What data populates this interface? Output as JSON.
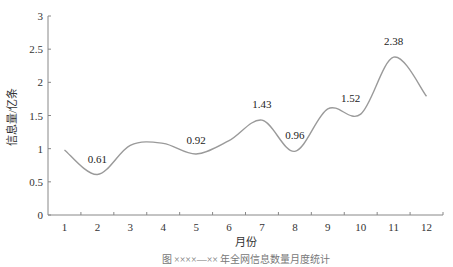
{
  "chart_data": {
    "type": "line",
    "title": "",
    "xlabel": "月份",
    "ylabel": "信息量/亿条",
    "categories": [
      "1",
      "2",
      "3",
      "4",
      "5",
      "6",
      "7",
      "8",
      "9",
      "10",
      "11",
      "12"
    ],
    "x": [
      1,
      2,
      3,
      4,
      5,
      6,
      7,
      8,
      9,
      10,
      11,
      12
    ],
    "values": [
      0.98,
      0.61,
      1.05,
      1.08,
      0.92,
      1.12,
      1.43,
      0.96,
      1.6,
      1.52,
      2.38,
      1.79
    ],
    "data_labels": [
      {
        "x": 2,
        "text": "0.61"
      },
      {
        "x": 5,
        "text": "0.92"
      },
      {
        "x": 7,
        "text": "1.43"
      },
      {
        "x": 8,
        "text": "0.96"
      },
      {
        "x": 10,
        "text": "1.52"
      },
      {
        "x": 11,
        "text": "2.38"
      }
    ],
    "yticks": [
      "0",
      "0.5",
      "1",
      "1.5",
      "2",
      "2.5",
      "3"
    ],
    "ylim": [
      0,
      3
    ],
    "xlim": [
      0.5,
      12.5
    ],
    "grid": false,
    "legend": null,
    "smooth": true,
    "line_color": "#9a9a9a"
  },
  "caption": "图 ××××—×× 年全网信息数量月度统计",
  "colors": {
    "axis": "#888888",
    "line": "#9a9a9a",
    "text": "#333333"
  }
}
